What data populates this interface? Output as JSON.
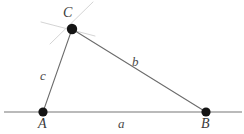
{
  "figure": {
    "name": "triangle-abc-on-baseline",
    "canvas": {
      "width": 244,
      "height": 134
    },
    "background_color": "#ffffff",
    "stroke_color": "#6b6b6b",
    "baseline_color": "#777777",
    "construction_color": "#cfcfcf",
    "vertex_fill": "#141414",
    "label_color": "#3a3a3a"
  },
  "vertices": [
    {
      "id": "A",
      "label": "A",
      "x": 43,
      "y": 112,
      "radius": 4.6,
      "label_x": 38,
      "label_y": 117
    },
    {
      "id": "B",
      "label": "B",
      "x": 206,
      "y": 112,
      "radius": 4.6,
      "label_x": 201,
      "label_y": 117
    },
    {
      "id": "C",
      "label": "C",
      "x": 72,
      "y": 29,
      "radius": 5.2,
      "label_x": 63,
      "label_y": 6
    }
  ],
  "sides": [
    {
      "id": "a",
      "label": "a",
      "from": "A",
      "to": "B",
      "label_x": 118,
      "label_y": 117
    },
    {
      "id": "b",
      "label": "b",
      "from": "C",
      "to": "B",
      "label_x": 132,
      "label_y": 55
    },
    {
      "id": "c",
      "label": "c",
      "from": "A",
      "to": "C",
      "label_x": 40,
      "label_y": 69
    }
  ],
  "baseline": {
    "name": "horizontal-baseline",
    "x1": 4,
    "y1": 112,
    "x2": 242,
    "y2": 112
  },
  "construction_lines": [
    {
      "id": "cl1",
      "x1": 41,
      "y1": 22,
      "x2": 95,
      "y2": 36
    },
    {
      "id": "cl2",
      "x1": 50,
      "y1": 44,
      "x2": 93,
      "y2": 2
    }
  ]
}
